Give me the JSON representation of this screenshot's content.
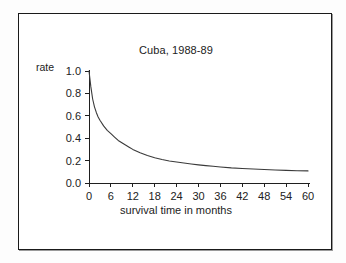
{
  "figure": {
    "border_color": "#1a1a1a",
    "background": "#ffffff"
  },
  "chart_data": {
    "type": "line",
    "title": "Cuba, 1988-89",
    "xlabel": "survival time in months",
    "ylabel": "rate",
    "xlim": [
      0,
      60
    ],
    "ylim": [
      0.0,
      1.0
    ],
    "grid": false,
    "legend": null,
    "line_color": "#3a3a3a",
    "xticks": [
      0,
      6,
      12,
      18,
      24,
      30,
      36,
      42,
      48,
      54,
      60
    ],
    "xtick_labels": [
      "0",
      "6",
      "12",
      "18",
      "24",
      "30",
      "36",
      "42",
      "48",
      "54",
      "60"
    ],
    "yticks": [
      0.0,
      0.2,
      0.4,
      0.6,
      0.8,
      1.0
    ],
    "ytick_labels": [
      "0.0",
      "0.2",
      "0.4",
      "0.6",
      "0.8",
      "1.0"
    ],
    "series": [
      {
        "name": "survival rate",
        "x": [
          0,
          0.5,
          1,
          1.5,
          2,
          2.5,
          3,
          4,
          5,
          6,
          7,
          8,
          9,
          10,
          11,
          12,
          14,
          16,
          18,
          20,
          22,
          24,
          26,
          28,
          30,
          32,
          34,
          36,
          39,
          42,
          45,
          48,
          51,
          54,
          57,
          60
        ],
        "values": [
          1.0,
          0.86,
          0.75,
          0.68,
          0.63,
          0.59,
          0.56,
          0.51,
          0.47,
          0.44,
          0.41,
          0.38,
          0.36,
          0.34,
          0.32,
          0.3,
          0.27,
          0.245,
          0.225,
          0.21,
          0.197,
          0.187,
          0.178,
          0.17,
          0.162,
          0.155,
          0.149,
          0.143,
          0.135,
          0.13,
          0.125,
          0.12,
          0.116,
          0.113,
          0.11,
          0.108
        ]
      }
    ]
  }
}
